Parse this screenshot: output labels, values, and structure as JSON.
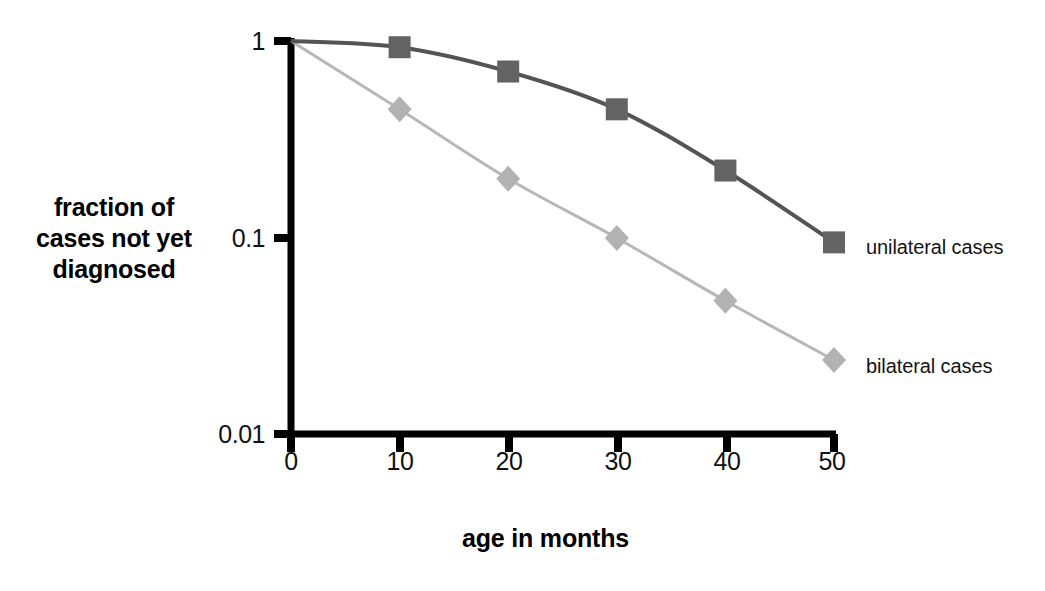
{
  "chart_data": {
    "type": "line",
    "title": "",
    "subtitle": "",
    "xlabel": "age in months",
    "ylabel": "fraction of cases not yet diagnosed",
    "ylabel_lines": [
      "fraction of",
      "cases not yet",
      "diagnosed"
    ],
    "x": [
      0,
      10,
      20,
      30,
      40,
      50
    ],
    "xlim": [
      0,
      50
    ],
    "ylim": [
      0.01,
      1
    ],
    "yscale": "log",
    "xscale": "linear",
    "grid": false,
    "legend_position": "right-of-line-ends",
    "xticks": [
      "0",
      "10",
      "20",
      "30",
      "40",
      "50"
    ],
    "yticks": [
      "1",
      "0.1",
      "0.01"
    ],
    "ytick_values": [
      1,
      0.1,
      0.01
    ],
    "series": [
      {
        "name": "unilateral cases",
        "marker": "square",
        "color": "#636363",
        "line_color": "#545454",
        "values": [
          1.0,
          0.93,
          0.7,
          0.45,
          0.22,
          0.095
        ],
        "markers_drawn_at_x": [
          10,
          20,
          30,
          40,
          50
        ]
      },
      {
        "name": "bilateral cases",
        "marker": "diamond",
        "color": "#b2b2b2",
        "line_color": "#b7b7b7",
        "values": [
          1.0,
          0.45,
          0.2,
          0.1,
          0.048,
          0.024
        ],
        "markers_drawn_at_x": [
          10,
          20,
          30,
          40,
          50
        ]
      }
    ],
    "annotations": []
  },
  "axis": {
    "axis_color": "#000000",
    "x_title": "age in months",
    "y_title_line1": "fraction of",
    "y_title_line2": "cases not yet",
    "y_title_line3": "diagnosed"
  },
  "ticks": {
    "y": [
      {
        "label": "1",
        "value": 1
      },
      {
        "label": "0.1",
        "value": 0.1
      },
      {
        "label": "0.01",
        "value": 0.01
      }
    ],
    "x": [
      {
        "label": "0",
        "value": 0
      },
      {
        "label": "10",
        "value": 10
      },
      {
        "label": "20",
        "value": 20
      },
      {
        "label": "30",
        "value": 30
      },
      {
        "label": "40",
        "value": 40
      },
      {
        "label": "50",
        "value": 50
      }
    ]
  },
  "legend": {
    "unilateral_label": "unilateral cases",
    "bilateral_label": "bilateral cases"
  }
}
